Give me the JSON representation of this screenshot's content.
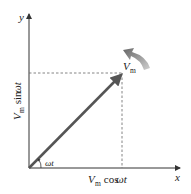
{
  "diagram": {
    "type": "phasor",
    "axes": {
      "x_label": "x",
      "y_label": "y"
    },
    "phasor": {
      "label_main": "V",
      "label_sub": "m"
    },
    "angle_label": "ωt",
    "x_projection": {
      "main": "V",
      "sub": "m",
      "func": " cos ",
      "arg": "ωt"
    },
    "y_projection": {
      "main": "V",
      "sub": "m",
      "func": " sin ",
      "arg": "ωt"
    },
    "rotation_arrow": "counterclockwise",
    "colors": {
      "axis": "#333333",
      "phasor": "#555555",
      "dashed": "#666666",
      "rotation_arrow": "#777777"
    }
  }
}
